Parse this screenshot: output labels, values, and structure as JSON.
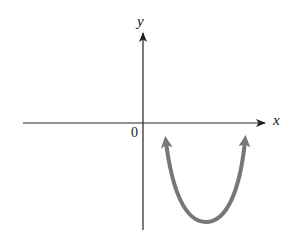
{
  "diagram": {
    "type": "coordinate-plane-parabola",
    "axes": {
      "x_label": "x",
      "y_label": "y",
      "origin_label": "0",
      "color": "#222222"
    },
    "curve": {
      "shape": "upward-opening parabola",
      "location": "below x-axis, right of y-axis (vertex in quadrant IV)",
      "both_ends": "arrows pointing upward",
      "color": "#777777"
    }
  }
}
